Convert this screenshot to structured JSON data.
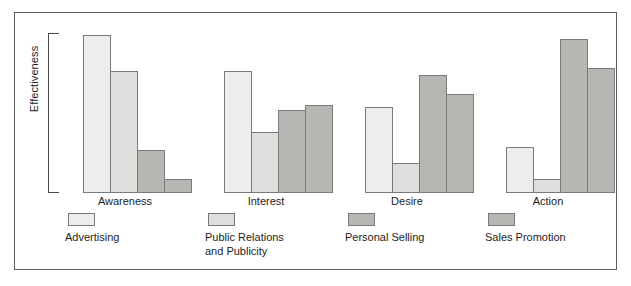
{
  "chart_data": {
    "type": "bar",
    "title": "",
    "xlabel": "",
    "ylabel": "Effectiveness",
    "ylim": [
      0,
      100
    ],
    "grid": false,
    "legend_position": "bottom",
    "categories": [
      "Awareness",
      "Interest",
      "Desire",
      "Action"
    ],
    "series": [
      {
        "name": "Advertising",
        "color": "#ededeb",
        "values": [
          99,
          76,
          54,
          29
        ]
      },
      {
        "name": "Public Relations and Publicity",
        "color": "#dededc",
        "values": [
          76,
          38,
          19,
          9
        ]
      },
      {
        "name": "Personal Selling",
        "color": "#b6b6b3",
        "values": [
          27,
          52,
          74,
          96
        ]
      },
      {
        "name": "Sales Promotion",
        "color": "#b6b6b3",
        "values": [
          9,
          55,
          62,
          78
        ]
      }
    ]
  },
  "axis": {
    "y_label": "Effectiveness"
  },
  "categories": [
    {
      "label": "Awareness"
    },
    {
      "label": "Interest"
    },
    {
      "label": "Desire"
    },
    {
      "label": "Action"
    }
  ],
  "legend": [
    {
      "label": "Advertising",
      "line1": "Advertising",
      "line2": "",
      "color": "#ededeb"
    },
    {
      "label": "Public Relations and Publicity",
      "line1": "Public Relations",
      "line2": "and Publicity",
      "color": "#dededc"
    },
    {
      "label": "Personal Selling",
      "line1": "Personal Selling",
      "line2": "",
      "color": "#b6b6b3"
    },
    {
      "label": "Sales Promotion",
      "line1": "Sales Promotion",
      "line2": "",
      "color": "#b6b6b3"
    }
  ],
  "colors": {
    "frame_border": "#5d5d5d",
    "bar_border": "#7a7a7a",
    "bracket": "#4a4a4a",
    "background": "#ffffff",
    "text": "#1d1d1d"
  }
}
